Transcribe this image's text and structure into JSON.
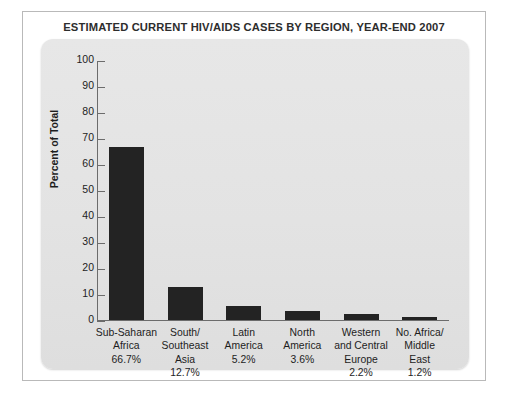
{
  "chart_data": {
    "type": "bar",
    "title": "ESTIMATED CURRENT HIV/AIDS CASES BY REGION, YEAR-END 2007",
    "xlabel": "",
    "ylabel": "Percent of Total",
    "ylim": [
      0,
      100
    ],
    "ytick_step": 10,
    "grid": false,
    "legend": false,
    "bar_color": "#232323",
    "panel_color": "#e3e3e3",
    "yticks": [
      100,
      90,
      80,
      70,
      60,
      50,
      40,
      30,
      20,
      10,
      0
    ],
    "categories": [
      "Sub-Saharan\nAfrica",
      "South/\nSoutheast\nAsia",
      "Latin\nAmerica",
      "North\nAmerica",
      "Western\nand Central\nEurope",
      "No. Africa/\nMiddle\nEast"
    ],
    "values": [
      66.7,
      12.7,
      5.2,
      3.6,
      2.2,
      1.2
    ],
    "data_labels": [
      "66.7%",
      "12.7%",
      "5.2%",
      "3.6%",
      "2.2%",
      "1.2%"
    ],
    "points": [
      {
        "category": "Sub-Saharan Africa",
        "value": 66.7,
        "label": "66.7%",
        "lines": [
          "Sub-Saharan",
          "Africa",
          "66.7%"
        ]
      },
      {
        "category": "South/Southeast Asia",
        "value": 12.7,
        "label": "12.7%",
        "lines": [
          "South/",
          "Southeast",
          "Asia",
          "12.7%"
        ]
      },
      {
        "category": "Latin America",
        "value": 5.2,
        "label": "5.2%",
        "lines": [
          "Latin",
          "America",
          "5.2%"
        ]
      },
      {
        "category": "North America",
        "value": 3.6,
        "label": "3.6%",
        "lines": [
          "North",
          "America",
          "3.6%"
        ]
      },
      {
        "category": "Western and Central Europe",
        "value": 2.2,
        "label": "2.2%",
        "lines": [
          "Western",
          "and Central",
          "Europe",
          "2.2%"
        ]
      },
      {
        "category": "No. Africa/Middle East",
        "value": 1.2,
        "label": "1.2%",
        "lines": [
          "No. Africa/",
          "Middle",
          "East",
          "1.2%"
        ]
      }
    ]
  }
}
